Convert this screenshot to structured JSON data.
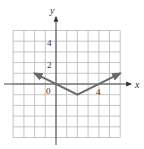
{
  "graph": {
    "x_axis_label": "x",
    "y_axis_label": "y",
    "origin_label": "0",
    "tick_labels": {
      "x": [
        {
          "value": 4,
          "text": "4"
        }
      ],
      "y": [
        {
          "value": 2,
          "text": "2"
        },
        {
          "value": 4,
          "text": "4"
        }
      ]
    },
    "grid": {
      "xmin": -4,
      "xmax": 6,
      "ymin": -5,
      "ymax": 5,
      "step": 1
    },
    "colors": {
      "grid": "#b8b8b8",
      "axis": "#444444",
      "curve": "#6a6a6a",
      "background": "#ffffff"
    },
    "curve": {
      "type": "absolute-value",
      "description": "V-shaped graph with vertex at (2,-1), arrows at both ends",
      "points": [
        [
          -2,
          1
        ],
        [
          2,
          -1
        ],
        [
          6,
          1
        ]
      ],
      "vertex": [
        2,
        -1
      ]
    }
  }
}
